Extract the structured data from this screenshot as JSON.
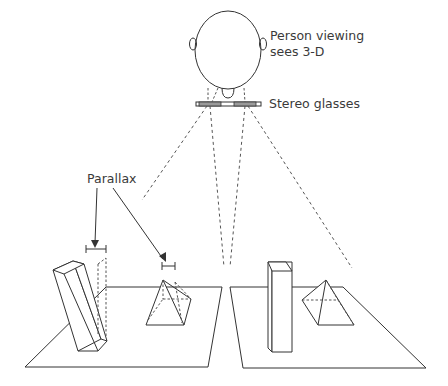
{
  "diagram": {
    "labels": {
      "viewer_line1": "Person viewing",
      "viewer_line2": "sees 3-D",
      "glasses": "Stereo glasses",
      "parallax": "Parallax"
    },
    "colors": {
      "line": "#333333",
      "text": "#3a3a3a",
      "lens": "#9a9a9a",
      "background": "#ffffff"
    },
    "elements": [
      "head-outline",
      "stereo-glasses",
      "left-image-plane",
      "right-image-plane",
      "tilted-prism-left",
      "pyramid-left",
      "upright-prism-right",
      "pyramid-right",
      "parallax-markers",
      "sight-lines"
    ]
  }
}
